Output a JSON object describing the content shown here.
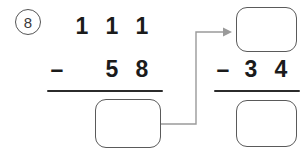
{
  "worksheet": {
    "problem_number": "8",
    "problem_number_style": "circled",
    "background_color": "#ffffff",
    "ink_color": "#1b1b1b",
    "box_border_color": "#5a5a5a",
    "arrow_color": "#9a9a9a"
  },
  "left_problem": {
    "minuend": {
      "label": "111",
      "digits": [
        "1",
        "1",
        "1"
      ]
    },
    "operator": "–",
    "subtrahend": {
      "label": "58",
      "digits": [
        "5",
        "8"
      ]
    },
    "answer": "",
    "answer_placeholder": ""
  },
  "right_problem": {
    "minuend": "",
    "minuend_placeholder": "",
    "operator": "–",
    "subtrahend": {
      "label": "34",
      "digits": [
        "3",
        "4"
      ]
    },
    "answer": "",
    "answer_placeholder": ""
  },
  "connector": {
    "icon": "arrow-right-icon",
    "from": "left-problem-answer-box",
    "to": "right-problem-minuend-box"
  }
}
